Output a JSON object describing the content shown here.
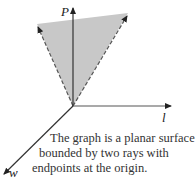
{
  "axes": {
    "vertical_label": "P",
    "horizontal_label": "l",
    "depth_label": "w"
  },
  "surface": {
    "fill": "#c8c8c8",
    "edge_color": "#555555",
    "edge_style": "dashed"
  },
  "caption": {
    "line1": "The graph is a planar surface",
    "line2": "bounded by two rays with",
    "line3": "endpoints at the origin."
  }
}
